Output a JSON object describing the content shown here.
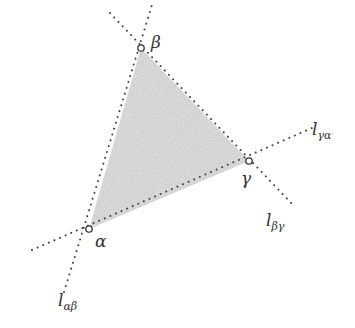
{
  "diagram": {
    "colors": {
      "line": "#444444",
      "fill": "#d6d6d6",
      "text": "#333333",
      "background": "#ffffff"
    },
    "vertices": [
      {
        "id": "beta",
        "label": "β",
        "x": 141,
        "y": 48,
        "label_x": 151,
        "label_y": 48
      },
      {
        "id": "gamma",
        "label": "γ",
        "x": 249,
        "y": 161,
        "label_x": 241,
        "label_y": 184
      },
      {
        "id": "alpha",
        "label": "α",
        "x": 89,
        "y": 229,
        "label_x": 95,
        "label_y": 247
      }
    ],
    "lines": [
      {
        "id": "l_alpha_beta",
        "base": "l",
        "sub": "αβ",
        "x1": 64,
        "y1": 292,
        "x2": 152,
        "y2": 5,
        "label_x": 58,
        "label_y": 306
      },
      {
        "id": "l_beta_gamma",
        "base": "l",
        "sub": "βγ",
        "x1": 110,
        "y1": 13,
        "x2": 294,
        "y2": 206,
        "label_x": 266,
        "label_y": 226
      },
      {
        "id": "l_gamma_alpha",
        "base": "l",
        "sub": "γα",
        "x1": 32,
        "y1": 250,
        "x2": 312,
        "y2": 128,
        "label_x": 312,
        "label_y": 135
      }
    ]
  }
}
